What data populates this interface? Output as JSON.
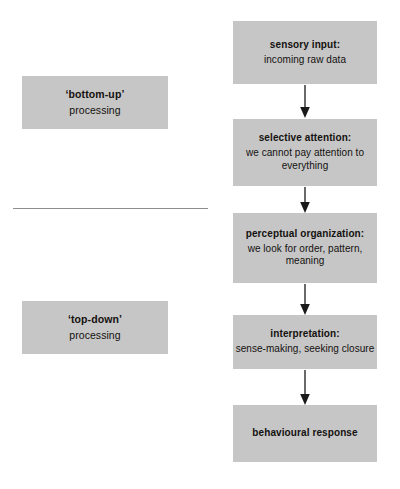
{
  "diagram": {
    "colors": {
      "box_fill": "#c6c6c6",
      "text": "#14110f",
      "arrow": "#1a1a1a",
      "divider": "#8e8e8e",
      "background": "#ffffff"
    },
    "side_labels": [
      {
        "id": "bottom-up",
        "title": "‘bottom-up’",
        "sub": "processing"
      },
      {
        "id": "top-down",
        "title": "‘top-down’",
        "sub": "processing"
      }
    ],
    "divider": {
      "present": true
    },
    "stages": [
      {
        "id": "sensory-input",
        "title": "sensory input:",
        "sub": "incoming raw data"
      },
      {
        "id": "selective-attention",
        "title": "selective attention:",
        "sub": "we cannot pay attention to everything"
      },
      {
        "id": "perceptual-organization",
        "title": "perceptual organization:",
        "sub": "we look for order, pattern, meaning"
      },
      {
        "id": "interpretation",
        "title": "interpretation:",
        "sub": "sense-making, seeking closure"
      },
      {
        "id": "behavioural-response",
        "title": "behavioural response",
        "sub": ""
      }
    ],
    "connectors": [
      {
        "id": "arrow-sensory-to-attention"
      },
      {
        "id": "arrow-attention-to-perceptual"
      },
      {
        "id": "arrow-perceptual-to-interpretation"
      },
      {
        "id": "arrow-interpretation-to-response"
      }
    ]
  }
}
